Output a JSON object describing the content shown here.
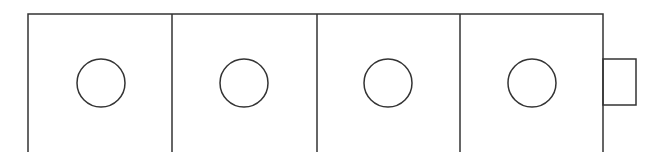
{
  "diagram": {
    "stroke_color": "#333333",
    "background": "#ffffff",
    "outer_box": {
      "x": 28,
      "y": 14,
      "width": 575,
      "height": 150
    },
    "panels": [
      {
        "id": 1,
        "x": 28,
        "width": 144,
        "circle": {
          "cx": 101,
          "cy": 83,
          "r": 24
        }
      },
      {
        "id": 2,
        "x": 172,
        "width": 145,
        "circle": {
          "cx": 244,
          "cy": 83,
          "r": 24
        }
      },
      {
        "id": 3,
        "x": 317,
        "width": 143,
        "circle": {
          "cx": 388,
          "cy": 83,
          "r": 24
        }
      },
      {
        "id": 4,
        "x": 460,
        "width": 143,
        "circle": {
          "cx": 532,
          "cy": 83,
          "r": 24
        }
      }
    ],
    "dividers_x": [
      172,
      317,
      460
    ],
    "side_tab": {
      "x": 603,
      "y": 59,
      "width": 33,
      "height": 46
    }
  }
}
